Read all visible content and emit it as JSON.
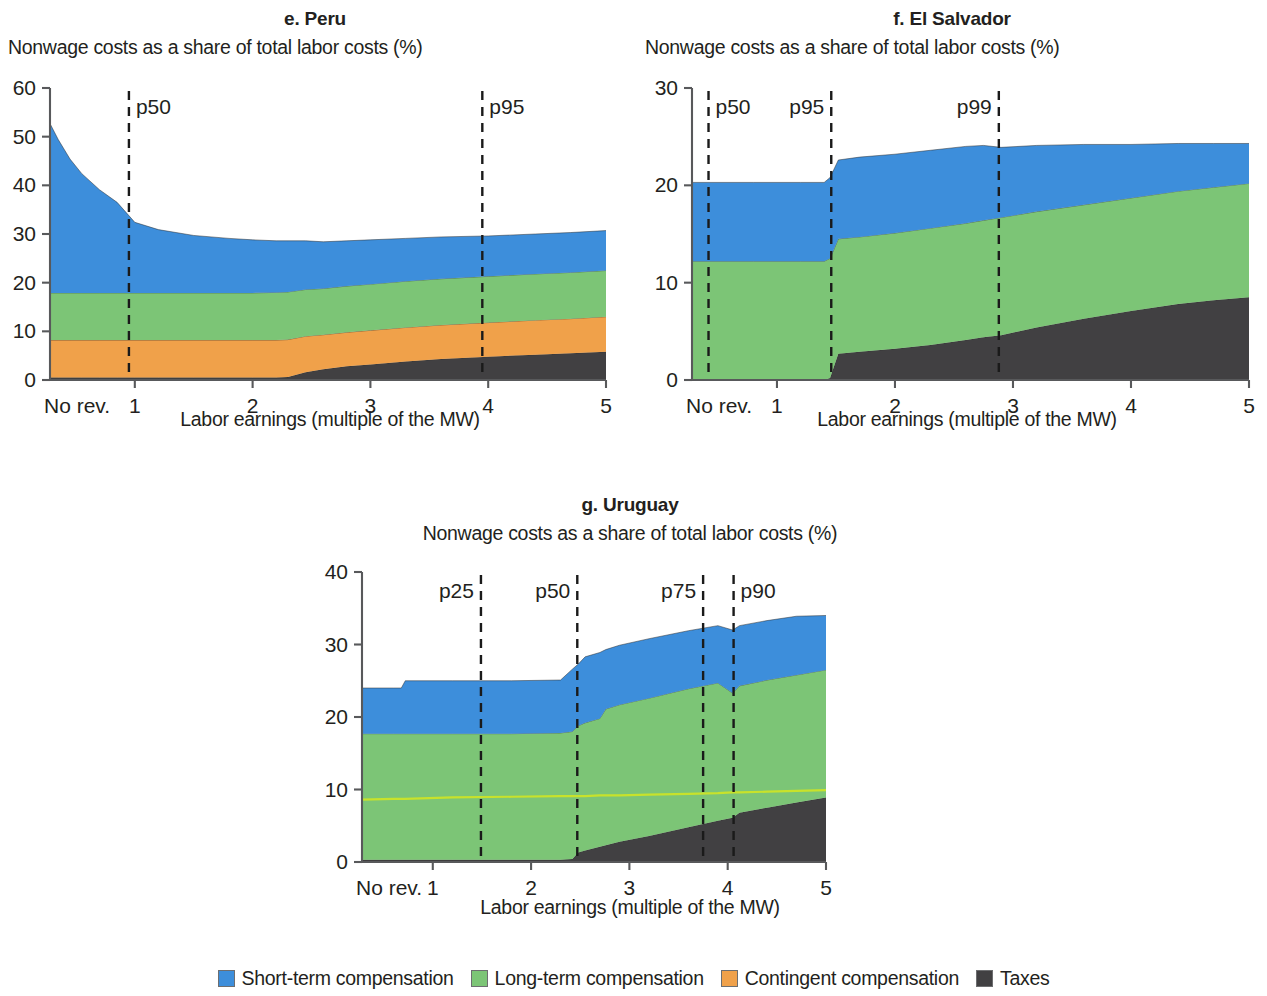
{
  "figure": {
    "subtitle_text": "Nonwage costs as a share of total labor costs (%)",
    "xaxis_title": "Labor earnings (multiple of the MW)",
    "origin_tick_label": "No rev."
  },
  "legend": {
    "items": [
      {
        "label": "Short-term compensation",
        "color": "#3d8edb",
        "key": "short_term"
      },
      {
        "label": "Long-term compensation",
        "color": "#7cc576",
        "key": "long_term"
      },
      {
        "label": "Contingent compensation",
        "color": "#f0a14a",
        "key": "contingent"
      },
      {
        "label": "Taxes",
        "color": "#414042",
        "key": "taxes"
      }
    ]
  },
  "colors": {
    "short_term": "#3d8edb",
    "long_term": "#7cc576",
    "contingent": "#f0a14a",
    "taxes": "#414042",
    "highlight_line": "#c8e22b",
    "axis": "#58595b",
    "text": "#231f20"
  },
  "chart_data": [
    {
      "id": "peru",
      "type": "area",
      "title": "e. Peru",
      "subtitle": "Nonwage costs as a share of total labor costs (%)",
      "xlabel": "Labor earnings (multiple of the MW)",
      "ylabel": "",
      "ylim": [
        0,
        60
      ],
      "yticks": [
        0,
        10,
        20,
        30,
        40,
        50,
        60
      ],
      "xlim": [
        0.28,
        5
      ],
      "xticks": [
        1,
        2,
        3,
        4,
        5
      ],
      "xtick_labels": [
        "1",
        "2",
        "3",
        "4",
        "5"
      ],
      "origin_label": "No rev.",
      "grid": false,
      "legend_position": "figure-bottom",
      "stack_order": [
        "taxes",
        "contingent",
        "long_term",
        "short_term"
      ],
      "x": [
        0.28,
        0.35,
        0.45,
        0.55,
        0.7,
        0.85,
        1.0,
        1.2,
        1.5,
        1.8,
        2.0,
        2.2,
        2.3,
        2.45,
        2.6,
        2.8,
        3.0,
        3.3,
        3.6,
        4.0,
        4.4,
        4.7,
        5.0
      ],
      "series": [
        {
          "name": "Taxes",
          "key": "taxes",
          "values": [
            0.5,
            0.5,
            0.5,
            0.5,
            0.5,
            0.5,
            0.5,
            0.5,
            0.5,
            0.5,
            0.5,
            0.5,
            0.6,
            1.6,
            2.2,
            2.8,
            3.2,
            3.8,
            4.3,
            4.8,
            5.2,
            5.5,
            5.8
          ]
        },
        {
          "name": "Contingent compensation",
          "key": "contingent",
          "values": [
            7.7,
            7.7,
            7.7,
            7.7,
            7.7,
            7.7,
            7.7,
            7.7,
            7.7,
            7.7,
            7.7,
            7.7,
            7.7,
            7.4,
            7.1,
            7.0,
            7.0,
            7.0,
            7.0,
            7.0,
            7.1,
            7.1,
            7.2
          ]
        },
        {
          "name": "Long-term compensation",
          "key": "long_term",
          "values": [
            9.7,
            9.7,
            9.7,
            9.7,
            9.7,
            9.7,
            9.7,
            9.7,
            9.7,
            9.7,
            9.7,
            9.8,
            9.8,
            9.6,
            9.5,
            9.5,
            9.5,
            9.5,
            9.5,
            9.5,
            9.5,
            9.5,
            9.5
          ]
        },
        {
          "name": "Short-term compensation",
          "key": "short_term",
          "values": [
            34.8,
            31.5,
            27.5,
            24.5,
            21.2,
            18.6,
            14.5,
            13.0,
            11.8,
            11.2,
            10.9,
            10.6,
            10.5,
            10.0,
            9.6,
            9.3,
            9.1,
            8.8,
            8.6,
            8.3,
            8.2,
            8.2,
            8.2
          ]
        }
      ],
      "totals": [
        52.7,
        49.4,
        45.4,
        42.4,
        39.1,
        36.5,
        32.4,
        30.9,
        29.7,
        29.1,
        28.8,
        28.6,
        28.6,
        28.6,
        28.4,
        28.6,
        28.8,
        29.1,
        29.4,
        29.6,
        30.0,
        30.3,
        30.7
      ],
      "percentile_markers": [
        {
          "label": "p50",
          "x": 0.95,
          "label_side": "right"
        },
        {
          "label": "p95",
          "x": 3.95,
          "label_side": "right"
        }
      ]
    },
    {
      "id": "el_salvador",
      "type": "area",
      "title": "f. El Salvador",
      "subtitle": "Nonwage costs as a share of total labor costs (%)",
      "xlabel": "Labor earnings (multiple of the MW)",
      "ylabel": "",
      "ylim": [
        0,
        30
      ],
      "yticks": [
        0,
        10,
        20,
        30
      ],
      "xlim": [
        0.28,
        5
      ],
      "xticks": [
        1,
        2,
        3,
        4,
        5
      ],
      "xtick_labels": [
        "1",
        "2",
        "3",
        "4",
        "5"
      ],
      "origin_label": "No rev.",
      "grid": false,
      "legend_position": "figure-bottom",
      "stack_order": [
        "taxes",
        "contingent",
        "long_term",
        "short_term"
      ],
      "x": [
        0.28,
        0.8,
        1.2,
        1.4,
        1.45,
        1.52,
        1.7,
        2.0,
        2.3,
        2.6,
        2.75,
        2.9,
        3.2,
        3.6,
        4.0,
        4.4,
        4.7,
        5.0
      ],
      "series": [
        {
          "name": "Taxes",
          "key": "taxes",
          "values": [
            0.0,
            0.0,
            0.0,
            0.0,
            0.2,
            2.7,
            2.9,
            3.2,
            3.6,
            4.1,
            4.4,
            4.6,
            5.4,
            6.3,
            7.1,
            7.8,
            8.2,
            8.5
          ]
        },
        {
          "name": "Contingent compensation",
          "key": "contingent",
          "values": [
            0.0,
            0.0,
            0.0,
            0.0,
            0.0,
            0.0,
            0.0,
            0.0,
            0.0,
            0.0,
            0.0,
            0.0,
            0.0,
            0.0,
            0.0,
            0.0,
            0.0,
            0.0
          ]
        },
        {
          "name": "Long-term compensation",
          "key": "long_term",
          "values": [
            12.2,
            12.2,
            12.2,
            12.2,
            12.3,
            11.8,
            11.8,
            11.9,
            12.0,
            12.0,
            12.0,
            12.1,
            11.9,
            11.7,
            11.6,
            11.6,
            11.6,
            11.7
          ]
        },
        {
          "name": "Short-term compensation",
          "key": "short_term",
          "values": [
            8.1,
            8.1,
            8.1,
            8.1,
            8.3,
            8.1,
            8.2,
            8.1,
            8.0,
            7.9,
            7.7,
            7.2,
            6.8,
            6.2,
            5.5,
            4.9,
            4.5,
            4.1
          ]
        }
      ],
      "totals": [
        20.3,
        20.3,
        20.3,
        20.3,
        20.8,
        22.6,
        22.9,
        23.2,
        23.6,
        24.0,
        24.1,
        23.9,
        24.1,
        24.2,
        24.2,
        24.3,
        24.3,
        24.3
      ],
      "percentile_markers": [
        {
          "label": "p50",
          "x": 0.42,
          "label_side": "right"
        },
        {
          "label": "p95",
          "x": 1.46,
          "label_side": "left"
        },
        {
          "label": "p99",
          "x": 2.88,
          "label_side": "left"
        }
      ]
    },
    {
      "id": "uruguay",
      "type": "area",
      "title": "g. Uruguay",
      "subtitle": "Nonwage costs as a share of total labor costs (%)",
      "xlabel": "Labor earnings (multiple of the MW)",
      "ylabel": "",
      "ylim": [
        0,
        40
      ],
      "yticks": [
        0,
        10,
        20,
        30,
        40
      ],
      "xlim": [
        0.28,
        5
      ],
      "xticks": [
        1,
        2,
        3,
        4,
        5
      ],
      "xtick_labels": [
        "1",
        "2",
        "3",
        "4",
        "5"
      ],
      "origin_label": "No rev.",
      "grid": false,
      "legend_position": "figure-bottom",
      "stack_order": [
        "taxes",
        "contingent",
        "long_term",
        "short_term"
      ],
      "x": [
        0.28,
        0.6,
        0.68,
        0.72,
        1.2,
        1.8,
        2.3,
        2.42,
        2.48,
        2.55,
        2.7,
        2.76,
        2.9,
        3.2,
        3.6,
        3.9,
        4.05,
        4.12,
        4.4,
        4.7,
        5.0
      ],
      "series": [
        {
          "name": "Taxes",
          "key": "taxes",
          "values": [
            0.3,
            0.3,
            0.3,
            0.3,
            0.3,
            0.3,
            0.3,
            0.4,
            1.3,
            1.6,
            2.1,
            2.3,
            2.8,
            3.6,
            4.8,
            5.7,
            6.1,
            6.8,
            7.5,
            8.2,
            8.9
          ]
        },
        {
          "name": "Contingent compensation",
          "key": "contingent",
          "values": [
            0.0,
            0.0,
            0.0,
            0.0,
            0.0,
            0.0,
            0.0,
            0.0,
            0.0,
            0.0,
            0.0,
            0.0,
            0.0,
            0.0,
            0.0,
            0.0,
            0.0,
            0.0,
            0.0,
            0.0,
            0.0
          ]
        },
        {
          "name": "Long-term compensation",
          "key": "long_term",
          "values": [
            17.4,
            17.4,
            17.4,
            17.4,
            17.4,
            17.4,
            17.5,
            17.6,
            17.5,
            17.6,
            17.7,
            18.8,
            18.9,
            19.0,
            19.1,
            19.0,
            17.2,
            17.5,
            17.6,
            17.6,
            17.6
          ]
        },
        {
          "name": "Short-term compensation",
          "key": "short_term",
          "values": [
            6.3,
            6.3,
            6.3,
            7.3,
            7.3,
            7.3,
            7.3,
            8.6,
            8.5,
            9.1,
            9.1,
            8.2,
            8.2,
            8.2,
            8.0,
            7.9,
            8.7,
            8.3,
            8.2,
            8.1,
            7.5
          ]
        }
      ],
      "totals": [
        24.0,
        24.0,
        24.0,
        25.0,
        25.0,
        25.0,
        25.1,
        26.6,
        27.3,
        28.3,
        28.9,
        29.3,
        29.9,
        30.8,
        31.9,
        32.6,
        32.0,
        32.6,
        33.3,
        33.9,
        34.0
      ],
      "highlight_line": {
        "name": "long-term sublevel",
        "color": "#c8e22b",
        "values": [
          8.6,
          8.7,
          8.7,
          8.7,
          8.9,
          9.0,
          9.1,
          9.1,
          9.1,
          9.1,
          9.2,
          9.2,
          9.2,
          9.3,
          9.4,
          9.5,
          9.6,
          9.6,
          9.7,
          9.8,
          9.9
        ]
      },
      "percentile_markers": [
        {
          "label": "p25",
          "x": 1.49,
          "label_side": "left"
        },
        {
          "label": "p50",
          "x": 2.47,
          "label_side": "left"
        },
        {
          "label": "p75",
          "x": 3.75,
          "label_side": "left"
        },
        {
          "label": "p90",
          "x": 4.06,
          "label_side": "right"
        }
      ]
    }
  ]
}
